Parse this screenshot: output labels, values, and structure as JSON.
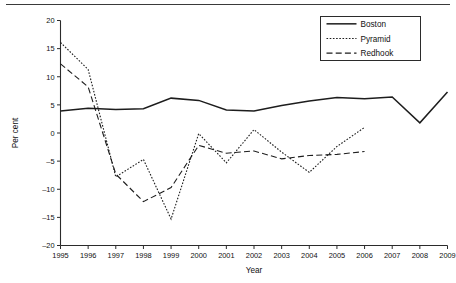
{
  "chart_data": {
    "type": "line",
    "title": "",
    "xlabel": "Year",
    "ylabel": "Per cent",
    "x": [
      1995,
      1996,
      1997,
      1998,
      1999,
      2000,
      2001,
      2002,
      2003,
      2004,
      2005,
      2006,
      2007,
      2008,
      2009
    ],
    "categories": [
      "1995",
      "1996",
      "1997",
      "1998",
      "1999",
      "2000",
      "2001",
      "2002",
      "2003",
      "2004",
      "2005",
      "2006",
      "2007",
      "2008",
      "2009"
    ],
    "xlim": [
      1995,
      2009
    ],
    "ylim": [
      -20,
      20
    ],
    "yticks": [
      -20,
      -15,
      -10,
      -5,
      0,
      5,
      10,
      15,
      20
    ],
    "ytick_labels": [
      "-20",
      "-15",
      "-10",
      "-5",
      "0",
      "5",
      "10",
      "15",
      "20"
    ],
    "xticks": [
      1995,
      1996,
      1997,
      1998,
      1999,
      2000,
      2001,
      2002,
      2003,
      2004,
      2005,
      2006,
      2007,
      2008,
      2009
    ],
    "grid": false,
    "legend_position": "top-right",
    "series": [
      {
        "name": "Boston",
        "style": "solid",
        "x": [
          1995,
          1996,
          1997,
          1998,
          1999,
          2000,
          2001,
          2002,
          2003,
          2004,
          2005,
          2006,
          2007,
          2008,
          2009
        ],
        "values": [
          3.9,
          4.4,
          4.2,
          4.3,
          6.2,
          5.8,
          4.1,
          3.9,
          4.9,
          5.7,
          6.3,
          6.1,
          6.4,
          1.8,
          7.3
        ]
      },
      {
        "name": "Pyramid",
        "style": "dotted",
        "x": [
          1995,
          1996,
          1997,
          1998,
          1999,
          2000,
          2001,
          2002,
          2003,
          2004,
          2005,
          2006
        ],
        "values": [
          16.1,
          11.3,
          -7.8,
          -4.7,
          -15.3,
          -0.1,
          -5.3,
          0.6,
          -3.4,
          -7.0,
          -2.4,
          1.0
        ]
      },
      {
        "name": "Redhook",
        "style": "dashed",
        "x": [
          1995,
          1996,
          1997,
          1998,
          1999,
          2000,
          2001,
          2002,
          2003,
          2004,
          2005,
          2006
        ],
        "values": [
          12.3,
          8.2,
          -7.3,
          -12.2,
          -9.7,
          -2.2,
          -3.6,
          -3.2,
          -4.6,
          -4.0,
          -3.8,
          -3.3
        ]
      }
    ]
  },
  "legend": {
    "items": [
      {
        "label": "Boston"
      },
      {
        "label": "Pyramid"
      },
      {
        "label": "Redhook"
      }
    ]
  },
  "axes": {
    "y_title": "Per cent",
    "x_title": "Year"
  }
}
